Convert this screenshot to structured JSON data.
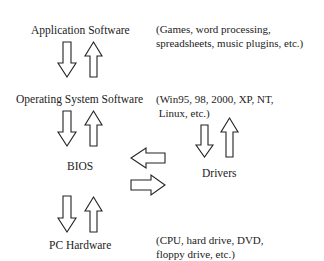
{
  "nodes": {
    "application_software": "Application Software",
    "operating_system_software": "Operating System Software",
    "bios": "BIOS",
    "drivers": "Drivers",
    "pc_hardware": "PC Hardware"
  },
  "notes": {
    "application_examples": [
      "(Games, word processing,",
      "spreadsheets, music plugins, etc.)"
    ],
    "os_examples": [
      "(Win95, 98, 2000, XP, NT,",
      " Linux, etc.)"
    ],
    "hardware_examples": [
      "(CPU, hard drive, DVD,",
      "floppy drive, etc.)"
    ]
  },
  "arrows": [
    {
      "from": "Application Software",
      "to": "Operating System Software",
      "type": "bidirectional-vertical"
    },
    {
      "from": "Operating System Software",
      "to": "BIOS",
      "type": "bidirectional-vertical"
    },
    {
      "from": "BIOS",
      "to": "Drivers",
      "type": "bidirectional-horizontal"
    },
    {
      "from": "Drivers",
      "to": "Operating System Software",
      "type": "bidirectional-vertical"
    },
    {
      "from": "BIOS",
      "to": "PC Hardware",
      "type": "bidirectional-vertical"
    }
  ]
}
